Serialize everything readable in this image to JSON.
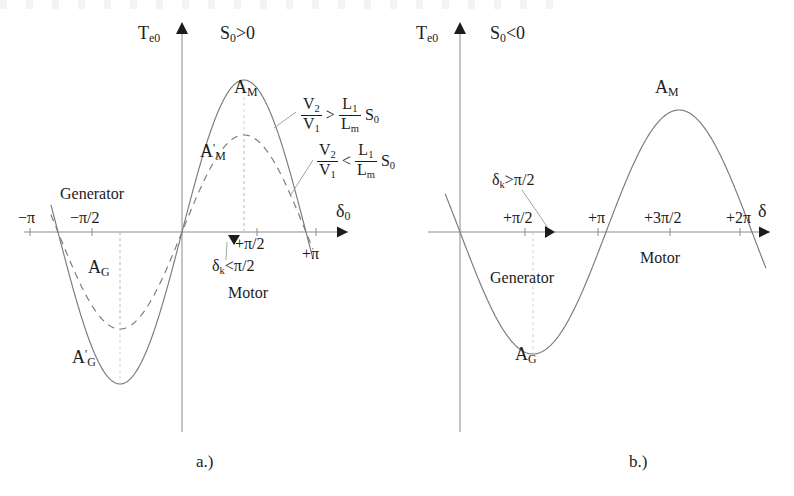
{
  "figure": {
    "background": "#ffffff",
    "ink": "#1c1c1c",
    "curve_color": "#7a7a7a",
    "axis_color": "#8a8a8a",
    "captions": [
      {
        "text": "a.)",
        "x": 196,
        "y": 452
      },
      {
        "text": "b.)",
        "x": 629,
        "y": 452
      }
    ]
  },
  "panel_a": {
    "name": "steady-state-torque-vs-delta-positive-slip",
    "axis": {
      "origin_x": 182,
      "axis_y": 232,
      "x_start": 24,
      "x_end": 348,
      "y_top": 22,
      "y_bottom": 432,
      "y_axis_label": "T",
      "y_axis_label_sub": "e0",
      "x_axis_label": "δ",
      "x_axis_label_sub": "0"
    },
    "condition": {
      "text": "S",
      "sub": "0",
      "rel": ">0"
    },
    "ticks": [
      {
        "label": "−π",
        "x": 30,
        "side": "above",
        "dx": -12,
        "dy": -22
      },
      {
        "label": "−π/2",
        "x": 92,
        "side": "above",
        "dx": -22,
        "dy": -22
      },
      {
        "label": "+π/2",
        "x": 257,
        "side": "below",
        "dx": -22,
        "dy": 4
      },
      {
        "label": "+π",
        "x": 316,
        "side": "below",
        "dx": -14,
        "dy": 14
      }
    ],
    "curves": [
      {
        "name": "solid-torque-curve",
        "style": "solid",
        "amplitude": 152,
        "phase_deg": 0
      },
      {
        "name": "dashed-torque-curve",
        "style": "dashed",
        "amplitude": 97,
        "phase_deg": 0
      }
    ],
    "curve_labels": [
      {
        "id": "A_M",
        "base": "A",
        "sub": "M",
        "prime": false,
        "x": 234,
        "y": 78
      },
      {
        "id": "A_Mp",
        "base": "A",
        "sub": "M",
        "prime": true,
        "x": 200,
        "y": 142
      },
      {
        "id": "A_G",
        "base": "A",
        "sub": "G",
        "prime": false,
        "x": 88,
        "y": 258
      },
      {
        "id": "A_Gp",
        "base": "A",
        "sub": "G",
        "prime": true,
        "x": 72,
        "y": 348
      }
    ],
    "region_labels": [
      {
        "text": "Generator",
        "x": 60,
        "y": 186
      },
      {
        "text": "Motor",
        "x": 228,
        "y": 285
      }
    ],
    "delta_k_note": {
      "base": "δ",
      "sub": "k",
      "rel": "<π/2",
      "x": 212,
      "y": 258,
      "marker_x": 234,
      "marker_y": 236
    },
    "inequalities": [
      {
        "id": "ineq-greater",
        "x": 300,
        "y": 97,
        "num": "V",
        "num_sub": "2",
        "den": "V",
        "den_sub": "1",
        "rel": ">",
        "rnum": "L",
        "rnum_sub": "1",
        "rden": "L",
        "rden_sub": "m",
        "tail": "S",
        "tail_sub": "0"
      },
      {
        "id": "ineq-less",
        "x": 316,
        "y": 143,
        "num": "V",
        "num_sub": "2",
        "den": "V",
        "den_sub": "1",
        "rel": "<",
        "rnum": "L",
        "rnum_sub": "1",
        "rden": "L",
        "rden_sub": "m",
        "tail": "S",
        "tail_sub": "0"
      }
    ]
  },
  "panel_b": {
    "name": "steady-state-torque-vs-delta-negative-slip",
    "axis": {
      "origin_x": 460,
      "axis_y": 232,
      "x_start": 428,
      "x_end": 770,
      "y_top": 22,
      "y_bottom": 432,
      "y_axis_label": "T",
      "y_axis_label_sub": "e0",
      "x_axis_label": "δ",
      "x_axis_label_sub": ""
    },
    "condition": {
      "text": "S",
      "sub": "0",
      "rel": "<0"
    },
    "ticks": [
      {
        "label": "+π/2",
        "x": 525,
        "side": "above",
        "dx": -22,
        "dy": -22
      },
      {
        "label": "+π",
        "x": 598,
        "side": "above",
        "dx": -10,
        "dy": -22
      },
      {
        "label": "+3π/2",
        "x": 670,
        "side": "above",
        "dx": -26,
        "dy": -22
      },
      {
        "label": "+2π",
        "x": 740,
        "side": "above",
        "dx": -14,
        "dy": -22
      }
    ],
    "curves": [
      {
        "name": "solid-torque-curve",
        "style": "solid",
        "amplitude": 122,
        "phase_deg": 180
      }
    ],
    "curve_labels": [
      {
        "id": "A_M",
        "base": "A",
        "sub": "M",
        "prime": false,
        "x": 655,
        "y": 78
      },
      {
        "id": "A_G",
        "base": "A",
        "sub": "G",
        "prime": false,
        "x": 515,
        "y": 345
      }
    ],
    "region_labels": [
      {
        "text": "Generator",
        "x": 490,
        "y": 270
      },
      {
        "text": "Motor",
        "x": 640,
        "y": 250
      }
    ],
    "delta_k_note": {
      "base": "δ",
      "sub": "k",
      "rel": ">π/2",
      "x": 492,
      "y": 172,
      "marker_x": 546,
      "marker_y": 224
    }
  },
  "chart_data": {
    "type": "line",
    "title": "",
    "panels": [
      {
        "id": "a",
        "caption": "a.)",
        "condition": "S0 > 0",
        "xlabel": "δ0",
        "ylabel": "Te0",
        "xticks": [
          "−π",
          "−π/2",
          "+π/2",
          "+π"
        ],
        "xtick_values": [
          -3.1416,
          -1.5708,
          1.5708,
          3.1416
        ],
        "xlim": [
          -3.55,
          3.6
        ],
        "grid": false,
        "legend": "none",
        "series": [
          {
            "name": "A_M / A_G (V2/V1 > (L1/Lm)S0)",
            "style": "solid",
            "form": "amplitude*sin(x)",
            "amplitude": 1.0,
            "x": [
              -3.1416,
              -2.3562,
              -1.5708,
              -0.7854,
              0,
              0.7854,
              1.5708,
              2.3562,
              3.1416
            ],
            "y": [
              0,
              -0.707,
              -1.0,
              -0.707,
              0,
              0.707,
              1.0,
              0.707,
              0
            ]
          },
          {
            "name": "A'_M / A'_G (V2/V1 < (L1/Lm)S0)",
            "style": "dashed",
            "form": "amplitude*sin(x)",
            "amplitude": 0.638,
            "x": [
              -3.1416,
              -2.3562,
              -1.5708,
              -0.7854,
              0,
              0.7854,
              1.5708,
              2.3562,
              3.1416
            ],
            "y": [
              0,
              -0.451,
              -0.638,
              -0.451,
              0,
              0.451,
              0.638,
              0.451,
              0
            ]
          }
        ],
        "annotations": [
          "S0 >0",
          "A_M",
          "A'_M",
          "A_G",
          "A'_G",
          "Generator",
          "Motor",
          "δk <π/2",
          "V2/V1 > (L1/Lm) S0",
          "V2/V1 < (L1/Lm) S0"
        ]
      },
      {
        "id": "b",
        "caption": "b.)",
        "condition": "S0 < 0",
        "xlabel": "δ",
        "ylabel": "Te0",
        "xticks": [
          "+π/2",
          "+π",
          "+3π/2",
          "+2π"
        ],
        "xtick_values": [
          1.5708,
          3.1416,
          4.7124,
          6.2832
        ],
        "xlim": [
          -0.45,
          6.8
        ],
        "grid": false,
        "legend": "none",
        "series": [
          {
            "name": "A_M / A_G",
            "style": "solid",
            "form": "amplitude*(-sin(x))",
            "amplitude": 1.0,
            "x": [
              0,
              0.7854,
              1.5708,
              2.3562,
              3.1416,
              3.927,
              4.7124,
              5.4978,
              6.2832
            ],
            "y": [
              0,
              -0.707,
              -1.0,
              -0.707,
              0,
              0.707,
              1.0,
              0.707,
              0
            ]
          }
        ],
        "annotations": [
          "S0 <0",
          "A_M",
          "A_G",
          "Generator",
          "Motor",
          "δk >π/2"
        ]
      }
    ]
  }
}
